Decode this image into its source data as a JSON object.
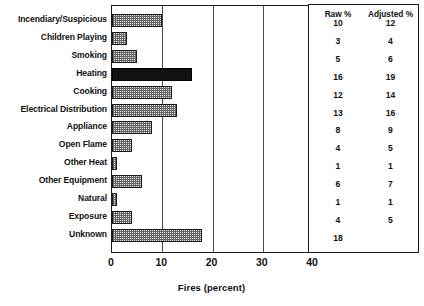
{
  "chart_data": {
    "type": "bar",
    "orientation": "horizontal",
    "title": "",
    "xlabel": "Fires (percent)",
    "ylabel": "",
    "xlim": [
      0,
      40
    ],
    "xticks": [
      0,
      10,
      20,
      30,
      40
    ],
    "grid": true,
    "gridlines_at": [
      10,
      20,
      30
    ],
    "legend": "none",
    "categories": [
      "Incendiary/Suspicious",
      "Children Playing",
      "Smoking",
      "Heating",
      "Cooking",
      "Electrical Distribution",
      "Appliance",
      "Open Flame",
      "Other Heat",
      "Other Equipment",
      "Natural",
      "Exposure",
      "Unknown"
    ],
    "values": [
      10,
      3,
      5,
      16,
      12,
      13,
      8,
      4,
      1,
      6,
      1,
      4,
      18
    ],
    "highlighted_category": "Heating",
    "series": [
      {
        "name": "Fires (percent)",
        "values": [
          10,
          3,
          5,
          16,
          12,
          13,
          8,
          4,
          1,
          6,
          1,
          4,
          18
        ]
      }
    ]
  },
  "table": {
    "headers": [
      "Raw %",
      "Adjusted %"
    ],
    "rows": [
      {
        "raw": "10",
        "adjusted": "12"
      },
      {
        "raw": "3",
        "adjusted": "4"
      },
      {
        "raw": "5",
        "adjusted": "6"
      },
      {
        "raw": "16",
        "adjusted": "19"
      },
      {
        "raw": "12",
        "adjusted": "14"
      },
      {
        "raw": "13",
        "adjusted": "16"
      },
      {
        "raw": "8",
        "adjusted": "9"
      },
      {
        "raw": "4",
        "adjusted": "5"
      },
      {
        "raw": "1",
        "adjusted": "1"
      },
      {
        "raw": "6",
        "adjusted": "7"
      },
      {
        "raw": "1",
        "adjusted": "1"
      },
      {
        "raw": "4",
        "adjusted": "5"
      },
      {
        "raw": "18",
        "adjusted": ""
      }
    ]
  },
  "colors": {
    "bar_fill": "#dedede",
    "bar_edge": "#1b1b1b",
    "highlight_fill": "#111111",
    "axis": "#1a1a1a",
    "text": "#111111"
  }
}
